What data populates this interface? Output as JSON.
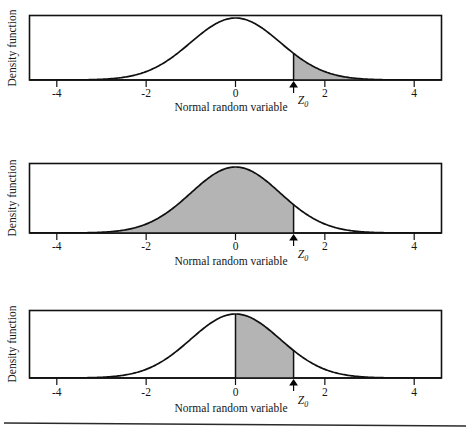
{
  "figure": {
    "background_color": "#ffffff",
    "ink_color": "#101010",
    "shade_color": "#b4b4b4",
    "bottom_rule": true
  },
  "labels": {
    "y_axis": "Density function",
    "x_axis": "Normal random variable",
    "z_symbol": "Z",
    "z_subscript": "0"
  },
  "axis": {
    "tick_labels": [
      "-4",
      "-2",
      "0",
      "2",
      "4"
    ],
    "tick_values": [
      -4,
      -2,
      0,
      2,
      4
    ],
    "xlim": [
      -4.6,
      4.6
    ]
  },
  "chart_data": [
    {
      "type": "area",
      "panel": 1,
      "title": "",
      "xlabel": "Normal random variable",
      "ylabel": "Density function",
      "distribution": "standard normal",
      "mean": 0,
      "sd": 1,
      "z0": 1.3,
      "shaded_region": "right tail: z > Z0",
      "shade_from": 1.3,
      "shade_to": 4.6,
      "xlim": [
        -4.6,
        4.6
      ],
      "ylim": [
        0,
        0.45
      ],
      "grid": false,
      "legend": "none",
      "annotations": [
        "Z0 arrow at x = 1.3"
      ],
      "tick_labels": [
        "-4",
        "-2",
        "0",
        "2",
        "4"
      ],
      "tick_values": [
        -4,
        -2,
        0,
        2,
        4
      ]
    },
    {
      "type": "area",
      "panel": 2,
      "title": "",
      "xlabel": "Normal random variable",
      "ylabel": "Density function",
      "distribution": "standard normal",
      "mean": 0,
      "sd": 1,
      "z0": 1.3,
      "shaded_region": "left cumulative: z < Z0",
      "shade_from": -4.6,
      "shade_to": 1.3,
      "xlim": [
        -4.6,
        4.6
      ],
      "ylim": [
        0,
        0.45
      ],
      "grid": false,
      "legend": "none",
      "annotations": [
        "Z0 arrow at x = 1.3"
      ],
      "tick_labels": [
        "-4",
        "-2",
        "0",
        "2",
        "4"
      ],
      "tick_values": [
        -4,
        -2,
        0,
        2,
        4
      ]
    },
    {
      "type": "area",
      "panel": 3,
      "title": "",
      "xlabel": "Normal random variable",
      "ylabel": "Density function",
      "distribution": "standard normal",
      "mean": 0,
      "sd": 1,
      "z0": 1.3,
      "shaded_region": "between 0 and Z0",
      "shade_from": 0,
      "shade_to": 1.3,
      "xlim": [
        -4.6,
        4.6
      ],
      "ylim": [
        0,
        0.45
      ],
      "grid": false,
      "legend": "none",
      "annotations": [
        "Z0 arrow at x = 1.3"
      ],
      "tick_labels": [
        "-4",
        "-2",
        "0",
        "2",
        "4"
      ],
      "tick_values": [
        -4,
        -2,
        0,
        2,
        4
      ]
    }
  ]
}
